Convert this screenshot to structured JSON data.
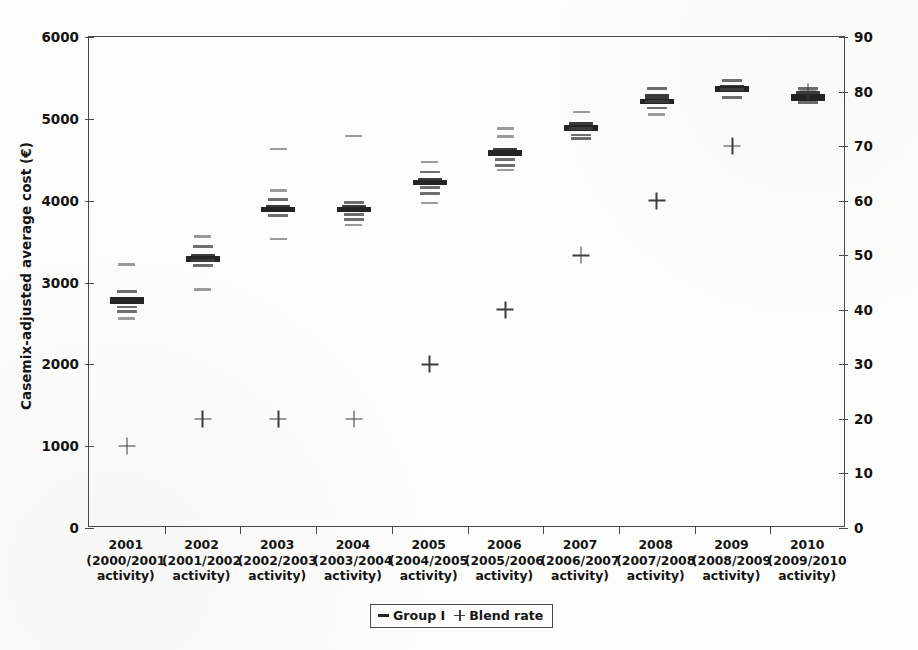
{
  "chart_data": {
    "type": "scatter",
    "title": "",
    "xlabel": "",
    "ylabel": "Casemix-adjusted average cost (€)",
    "ylabel_secondary": "Blend rate (%)",
    "ylim": [
      0,
      6000
    ],
    "ylim_secondary": [
      0,
      90
    ],
    "ytick_labels": [
      "6000",
      "5000",
      "4000",
      "3000",
      "2000",
      "1000",
      "0"
    ],
    "ytick_values": [
      6000,
      5000,
      4000,
      3000,
      2000,
      1000,
      0
    ],
    "ytick_labels_secondary": [
      "90",
      "80",
      "70",
      "60",
      "50",
      "40",
      "30",
      "20",
      "10",
      "0"
    ],
    "ytick_values_secondary": [
      90,
      80,
      70,
      60,
      50,
      40,
      30,
      20,
      10,
      0
    ],
    "grid": false,
    "legend_position": "bottom-center",
    "legend": [
      {
        "marker": "dash",
        "label": "Group I"
      },
      {
        "marker": "plus",
        "label": "Blend rate"
      }
    ],
    "categories": [
      {
        "year": "2001",
        "activity_line1": "(2000/2001",
        "activity_line2": "activity)"
      },
      {
        "year": "2002",
        "activity_line1": "(2001/2002",
        "activity_line2": "activity)"
      },
      {
        "year": "2003",
        "activity_line1": "(2002/2003",
        "activity_line2": "activity)"
      },
      {
        "year": "2004",
        "activity_line1": "(2003/2004",
        "activity_line2": "activity)"
      },
      {
        "year": "2005",
        "activity_line1": "(2004/2005",
        "activity_line2": "activity)"
      },
      {
        "year": "2006",
        "activity_line1": "(2005/2006",
        "activity_line2": "activity)"
      },
      {
        "year": "2007",
        "activity_line1": "(2006/2007",
        "activity_line2": "activity)"
      },
      {
        "year": "2008",
        "activity_line1": "(2007/2008",
        "activity_line2": "activity)"
      },
      {
        "year": "2009",
        "activity_line1": "(2008/2009",
        "activity_line2": "activity)"
      },
      {
        "year": "2010",
        "activity_line1": "(2009/2010",
        "activity_line2": "activity)"
      }
    ],
    "series": [
      {
        "name": "Group I",
        "marker": "dash",
        "note": "Each category shows a vertical spread of hospital-level casemix-adjusted average costs; the heavy dash marks the dense/median band.",
        "points": [
          {
            "category": "2001",
            "median": 2790,
            "values": [
              3220,
              2890,
              2800,
              2790,
              2780,
              2700,
              2640,
              2560
            ]
          },
          {
            "category": "2002",
            "median": 3290,
            "values": [
              3560,
              3440,
              3330,
              3300,
              3290,
              3270,
              3210,
              2910
            ]
          },
          {
            "category": "2003",
            "median": 3900,
            "values": [
              4630,
              4120,
              4010,
              3930,
              3910,
              3900,
              3820,
              3530
            ]
          },
          {
            "category": "2004",
            "median": 3905,
            "values": [
              4790,
              3980,
              3930,
              3910,
              3900,
              3830,
              3770,
              3700
            ]
          },
          {
            "category": "2005",
            "median": 4230,
            "values": [
              4470,
              4350,
              4260,
              4240,
              4230,
              4160,
              4090,
              3970
            ]
          },
          {
            "category": "2006",
            "median": 4590,
            "values": [
              4880,
              4780,
              4630,
              4600,
              4590,
              4500,
              4430,
              4370
            ]
          },
          {
            "category": "2007",
            "median": 4900,
            "values": [
              5080,
              4940,
              4910,
              4900,
              4880,
              4800,
              4760
            ]
          },
          {
            "category": "2008",
            "median": 5230,
            "values": [
              5370,
              5280,
              5250,
              5230,
              5210,
              5130,
              5050
            ]
          },
          {
            "category": "2009",
            "median": 5380,
            "values": [
              5470,
              5400,
              5385,
              5375,
              5360,
              5260
            ]
          },
          {
            "category": "2010",
            "median": 5270,
            "values": [
              5370,
              5320,
              5280,
              5270,
              5255,
              5200
            ]
          }
        ]
      },
      {
        "name": "Blend rate",
        "marker": "plus",
        "axis": "secondary",
        "unit": "%",
        "categories": [
          "2001",
          "2002",
          "2003",
          "2004",
          "2005",
          "2006",
          "2007",
          "2008",
          "2009",
          "2010"
        ],
        "values": [
          15,
          20,
          20,
          20,
          30,
          40,
          50,
          60,
          70,
          80
        ]
      }
    ]
  }
}
